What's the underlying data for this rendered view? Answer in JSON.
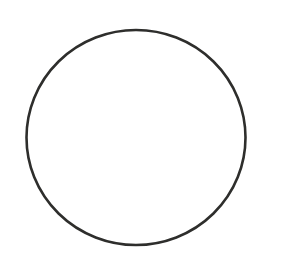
{
  "canvas": {
    "width": 302,
    "height": 279,
    "background_color": "#ffffff",
    "title": "Circle Outline"
  },
  "figure": {
    "name": "circle-outline",
    "shape_type": "ellipse",
    "center_x": 136,
    "center_y": 137.5,
    "radius_x": 109.5,
    "radius_y": 107.5,
    "bounds": {
      "left": 26.5,
      "right": 245.5,
      "top": 30,
      "bottom": 245
    },
    "stroke_color": "#2e2e2c",
    "stroke_width": 2.6,
    "fill": "none"
  },
  "annotations": {
    "labels": [],
    "text_present": false
  }
}
